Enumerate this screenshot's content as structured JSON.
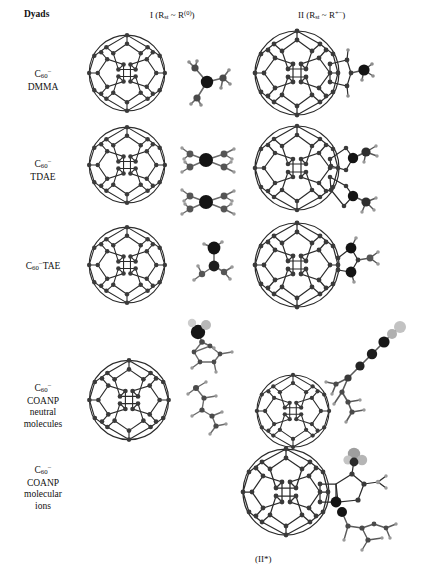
{
  "figure": {
    "title": "Dyads",
    "footer_note": "(II*)",
    "background": "#ffffff",
    "columns": [
      {
        "id": "col1",
        "label_plain": "I (Rst ~ R(0))",
        "label_parts": {
          "roman": "I",
          "open": " (R",
          "sub": "st",
          "tilde": " ~ R",
          "sup": "(0)",
          "close": ")"
        }
      },
      {
        "id": "col2",
        "label_plain": "II (Rst ~ R+-)",
        "label_parts": {
          "roman": "II",
          "open": " (R",
          "sub": "st",
          "tilde": " ~ R",
          "sup": "+−",
          "close": ")"
        }
      }
    ],
    "rows": [
      {
        "id": "row1",
        "lines": [
          "C60−",
          "DMMA"
        ],
        "molecule_line1_prefix": "C",
        "molecule_line1_sub": "60",
        "molecule_line1_sup": "−",
        "molecule_line2": "DMMA"
      },
      {
        "id": "row2",
        "lines": [
          "C60−",
          "TDAE"
        ],
        "molecule_line1_prefix": "C",
        "molecule_line1_sub": "60",
        "molecule_line1_sup": "−",
        "molecule_line2": "TDAE"
      },
      {
        "id": "row3",
        "lines": [
          "C60−TAE"
        ],
        "molecule_line1_prefix": "C",
        "molecule_line1_sub": "60",
        "molecule_line1_sup": "−",
        "molecule_line2": "TAE",
        "single_line": true
      },
      {
        "id": "row4",
        "lines": [
          "C60−",
          "COANP",
          "neutral",
          "molecules"
        ],
        "molecule_line1_prefix": "C",
        "molecule_line1_sub": "60",
        "molecule_line1_sup": "−",
        "molecule_line2": "COANP",
        "molecule_line3": "neutral",
        "molecule_line4": "molecules"
      },
      {
        "id": "row5",
        "lines": [
          "C60−",
          "COANP",
          "molecular",
          "ions"
        ],
        "molecule_line1_prefix": "C",
        "molecule_line1_sub": "60",
        "molecule_line1_sup": "−",
        "molecule_line2": "COANP",
        "molecule_line3": "molecular",
        "molecule_line4": "ions"
      }
    ],
    "colors": {
      "bond": "#2b2b2b",
      "carbon_atom": "#3a3a3a",
      "dark_atom": "#141414",
      "light_atom": "#b8b8b8",
      "text": "#111111",
      "background": "#ffffff"
    },
    "cells": [
      {
        "row": "row1",
        "column": "col1",
        "kind": "fullerene-cage",
        "present": true,
        "caption": ""
      },
      {
        "row": "row1",
        "column": "col1b",
        "kind": "dmma-molecule",
        "present": true,
        "caption": ""
      },
      {
        "row": "row1",
        "column": "col2",
        "kind": "fullerene-adduct",
        "present": true,
        "caption": ""
      },
      {
        "row": "row2",
        "column": "col1",
        "kind": "fullerene-cage",
        "present": true,
        "caption": ""
      },
      {
        "row": "row2",
        "column": "col1b",
        "kind": "tdae-molecule-pair",
        "present": true,
        "caption": ""
      },
      {
        "row": "row2",
        "column": "col2",
        "kind": "fullerene-adduct-double",
        "present": true,
        "caption": ""
      },
      {
        "row": "row3",
        "column": "col1",
        "kind": "fullerene-cage",
        "present": true,
        "caption": ""
      },
      {
        "row": "row3",
        "column": "col1b",
        "kind": "tae-molecule",
        "present": true,
        "caption": ""
      },
      {
        "row": "row3",
        "column": "col2",
        "kind": "fullerene-adduct",
        "present": true,
        "caption": ""
      },
      {
        "row": "row4",
        "column": "col1",
        "kind": "fullerene-cage",
        "present": true,
        "caption": ""
      },
      {
        "row": "row4",
        "column": "col1b",
        "kind": "coanp-neutral",
        "present": true,
        "caption": ""
      },
      {
        "row": "row4",
        "column": "col2",
        "kind": "coanp-chain",
        "present": true,
        "caption": ""
      },
      {
        "row": "row5",
        "column": "col2",
        "kind": "coanp-ion-adduct",
        "present": true,
        "caption": "(II*)"
      }
    ]
  }
}
